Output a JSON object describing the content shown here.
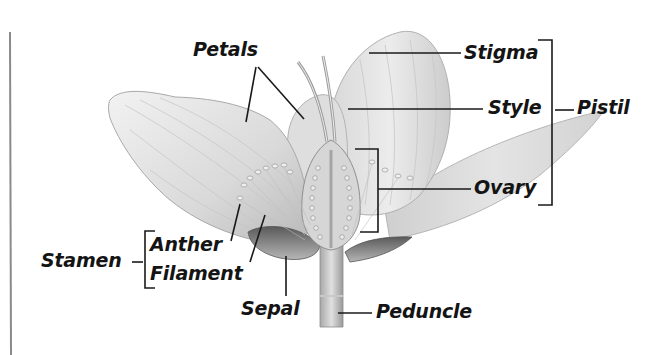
{
  "diagram": {
    "labels": {
      "petals": "Petals",
      "stigma": "Stigma",
      "style": "Style",
      "pistil": "Pistil",
      "ovary": "Ovary",
      "stamen": "Stamen",
      "anther": "Anther",
      "filament": "Filament",
      "sepal": "Sepal",
      "peduncle": "Peduncle"
    },
    "groups": [
      {
        "name": "Pistil",
        "members": [
          "Stigma",
          "Style",
          "Ovary"
        ]
      },
      {
        "name": "Stamen",
        "members": [
          "Anther",
          "Filament"
        ]
      }
    ],
    "colors": {
      "text": "#141414",
      "leader_line": "#1a1a1a",
      "petal_fill": "#e6e6e6",
      "petal_shade": "#bdbdbd",
      "sepal_dark": "#6e6e6e",
      "margin_rule": "#8a8a8a"
    }
  }
}
